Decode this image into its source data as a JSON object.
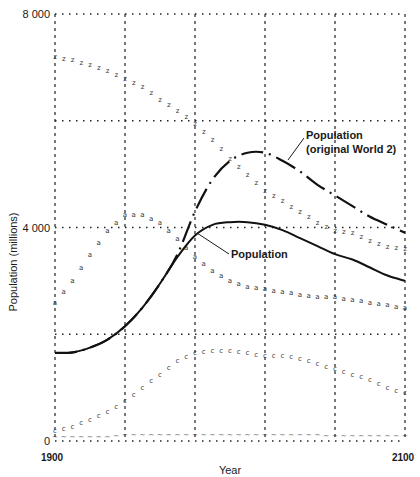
{
  "chart_data": {
    "type": "line",
    "title": "",
    "xlabel": "Year",
    "ylabel": "Population (millions)",
    "xlim": [
      1900,
      2100
    ],
    "ylim": [
      0,
      8000
    ],
    "x_ticks": [
      "1900",
      "2100"
    ],
    "y_ticks": [
      "0",
      "4 000",
      "8 000"
    ],
    "grid": {
      "vertical_dashed_years": [
        1900,
        1940,
        1980,
        2020,
        2060,
        2100
      ],
      "horizontal_dotted_values": [
        0,
        2000,
        4000,
        6000,
        8000
      ]
    },
    "annotations": [
      {
        "text": "Population",
        "target_series": "Population",
        "pointer": [
          1900,
          4000
        ]
      },
      {
        "text_line1": "Population",
        "text_line2": "(original World 2)",
        "target_series": "Population (original World 2)"
      }
    ],
    "x": [
      1900,
      1910,
      1920,
      1930,
      1940,
      1950,
      1960,
      1970,
      1980,
      1990,
      2000,
      2010,
      2020,
      2030,
      2040,
      2050,
      2060,
      2070,
      2080,
      2090,
      2100
    ],
    "series": [
      {
        "name": "Population",
        "style": "solid",
        "values": [
          1650,
          1660,
          1750,
          1900,
          2150,
          2500,
          2950,
          3450,
          3850,
          4050,
          4100,
          4100,
          4050,
          3950,
          3800,
          3650,
          3500,
          3400,
          3250,
          3100,
          3000
        ]
      },
      {
        "name": "Population (original World 2)",
        "style": "dash-dot",
        "values": [
          1650,
          1660,
          1750,
          1900,
          2150,
          2500,
          2950,
          3500,
          4300,
          4900,
          5250,
          5400,
          5400,
          5250,
          5050,
          4800,
          4600,
          4400,
          4200,
          4050,
          3900
        ]
      },
      {
        "name": "z-marker series",
        "marker": "z",
        "values": [
          7200,
          7150,
          7050,
          6950,
          6800,
          6650,
          6400,
          6200,
          5950,
          5650,
          5300,
          5000,
          4700,
          4500,
          4300,
          4100,
          3950,
          3900,
          3750,
          3650,
          3600
        ]
      },
      {
        "name": "a-marker series",
        "marker": "a",
        "values": [
          2600,
          3000,
          3500,
          3950,
          4250,
          4250,
          4100,
          3800,
          3450,
          3200,
          3000,
          2900,
          2850,
          2800,
          2750,
          2700,
          2700,
          2650,
          2600,
          2550,
          2500
        ]
      },
      {
        "name": "c-marker series",
        "marker": "c",
        "values": [
          200,
          280,
          400,
          550,
          750,
          1000,
          1250,
          1500,
          1650,
          1700,
          1700,
          1650,
          1600,
          1600,
          1550,
          1450,
          1350,
          1250,
          1150,
          1000,
          900
        ]
      },
      {
        "name": "n-marker series",
        "marker": "~",
        "values": [
          80,
          80,
          80,
          80,
          120,
          120,
          120,
          120,
          120,
          120,
          120,
          120,
          120,
          120,
          120,
          120,
          100,
          100,
          100,
          100,
          100
        ]
      }
    ]
  },
  "labels": {
    "y_axis_title": "Population (millions)",
    "x_axis_title": "Year",
    "x_tick_start": "1900",
    "x_tick_end": "2100",
    "y_tick_0": "0",
    "y_tick_4000": "4 000",
    "y_tick_8000": "8 000",
    "annotation_population": "Population",
    "annotation_original_line1": "Population",
    "annotation_original_line2": "(original World 2)"
  }
}
